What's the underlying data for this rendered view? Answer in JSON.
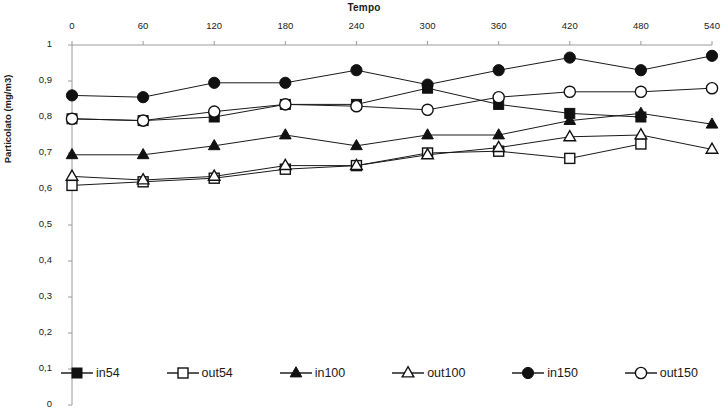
{
  "chart_data": {
    "type": "line",
    "title": "Tempo",
    "xlabel": "Tempo",
    "ylabel": "Particolato (mg/m3)",
    "x": [
      0,
      60,
      120,
      180,
      240,
      300,
      360,
      420,
      480,
      540
    ],
    "xtick_labels": [
      "0",
      "60",
      "120",
      "180",
      "240",
      "300",
      "360",
      "420",
      "480",
      "540"
    ],
    "ytick_labels": [
      "0",
      "0,1",
      "0,2",
      "0,3",
      "0,4",
      "0,5",
      "0,6",
      "0,7",
      "0,8",
      "0,9",
      "1"
    ],
    "ytick_values": [
      0,
      0.1,
      0.2,
      0.3,
      0.4,
      0.5,
      0.6,
      0.7,
      0.8,
      0.9,
      1
    ],
    "ylim": [
      0,
      1
    ],
    "xlim": [
      0,
      540
    ],
    "xaxis_position": "top",
    "grid": false,
    "legend_position": "bottom",
    "line_color": "#1a1a1a",
    "series": [
      {
        "name": "in54",
        "marker": "filled-square",
        "values": [
          0.795,
          0.79,
          0.8,
          0.835,
          0.835,
          0.88,
          0.835,
          0.81,
          0.8,
          null
        ]
      },
      {
        "name": "out54",
        "marker": "open-square",
        "values": [
          0.61,
          0.62,
          0.63,
          0.655,
          0.665,
          0.7,
          0.705,
          0.685,
          0.725,
          null
        ]
      },
      {
        "name": "in100",
        "marker": "filled-triangle",
        "values": [
          0.695,
          0.695,
          0.72,
          0.75,
          0.72,
          0.75,
          0.75,
          0.79,
          0.81,
          0.78
        ]
      },
      {
        "name": "out100",
        "marker": "open-triangle",
        "values": [
          0.635,
          0.625,
          0.635,
          0.665,
          0.665,
          0.695,
          0.715,
          0.745,
          0.75,
          0.71
        ]
      },
      {
        "name": "in150",
        "marker": "filled-circle",
        "values": [
          0.86,
          0.855,
          0.895,
          0.895,
          0.93,
          0.89,
          0.93,
          0.965,
          0.93,
          0.97
        ]
      },
      {
        "name": "out150",
        "marker": "open-circle",
        "values": [
          0.795,
          0.79,
          0.815,
          0.835,
          0.83,
          0.82,
          0.855,
          0.87,
          0.87,
          0.88
        ]
      }
    ]
  },
  "legend": {
    "items": [
      {
        "label": "in54",
        "marker": "filled-square"
      },
      {
        "label": "out54",
        "marker": "open-square"
      },
      {
        "label": "in100",
        "marker": "filled-triangle"
      },
      {
        "label": "out100",
        "marker": "open-triangle"
      },
      {
        "label": "in150",
        "marker": "filled-circle"
      },
      {
        "label": "out150",
        "marker": "open-circle"
      }
    ]
  }
}
